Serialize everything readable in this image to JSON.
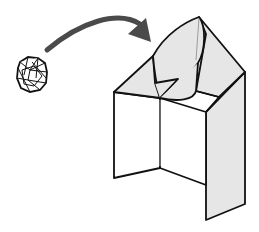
{
  "diagram": {
    "type": "origami-step",
    "elements": [
      {
        "id": "crumpled-paper",
        "label": "Crumpled paper ball"
      },
      {
        "id": "arrow",
        "label": "Curved arrow indicating insertion"
      },
      {
        "id": "folded-model",
        "label": "Folded paper model with open pocket"
      }
    ],
    "colors": {
      "stroke": "#111111",
      "arrow": "#4a4a4a",
      "shade": "#e6e6e6",
      "background": "#ffffff"
    }
  }
}
